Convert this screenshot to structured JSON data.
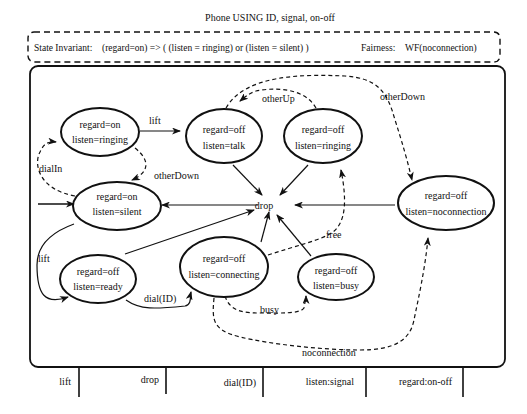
{
  "title": "Phone USING ID, signal, on-off",
  "invariant": {
    "label": "State Invariant:",
    "expr": "(regard=on) => ( (listen = ringing) or (listen = silent) )"
  },
  "fairness": {
    "label": "Fairness:",
    "expr": "WF(noconnection)"
  },
  "states": {
    "on_ringing": {
      "l1": "regard=on",
      "l2": "listen=ringing"
    },
    "on_silent": {
      "l1": "regard=on",
      "l2": "listen=silent"
    },
    "off_talk": {
      "l1": "regard=off",
      "l2": "listen=talk"
    },
    "off_ringing": {
      "l1": "regard=off",
      "l2": "listen=ringing"
    },
    "off_noconnection": {
      "l1": "regard=off",
      "l2": "listen=noconnection"
    },
    "off_ready": {
      "l1": "regard=off",
      "l2": "listen=ready"
    },
    "off_connecting": {
      "l1": "regard=off",
      "l2": "listen=connecting"
    },
    "off_busy": {
      "l1": "regard=off",
      "l2": "listen=busy"
    }
  },
  "junction": "drop",
  "transitions": {
    "lift_top": "lift",
    "dialIn": "dialIn",
    "otherDown_left": "otherDown",
    "otherUp": "otherUp",
    "otherDown_right": "otherDown",
    "lift_left": "lift",
    "dial": "dial(ID)",
    "free": "free",
    "busy": "busy",
    "noconnection": "noconnection"
  },
  "interface": [
    "lift",
    "drop",
    "dial(ID)",
    "listen:signal",
    "regard:on-off"
  ]
}
